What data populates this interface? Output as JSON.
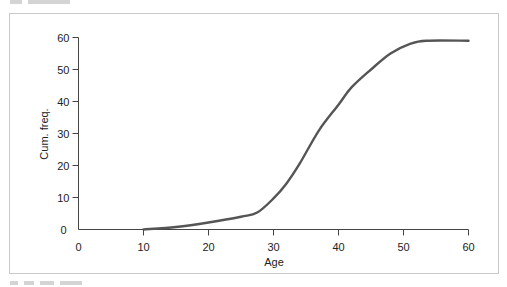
{
  "chart_data": {
    "type": "line",
    "title": "",
    "xlabel": "Age",
    "ylabel": "Cum. freq.",
    "xlim": [
      0,
      60
    ],
    "ylim": [
      0,
      60
    ],
    "xticks": [
      0,
      10,
      20,
      30,
      40,
      50,
      60
    ],
    "yticks": [
      0,
      10,
      20,
      30,
      40,
      50,
      60
    ],
    "grid": false,
    "legend": null,
    "series": [
      {
        "name": "Cumulative frequency",
        "color": "#555555",
        "x": [
          10,
          15,
          20,
          25,
          27.5,
          30,
          32,
          34,
          37,
          40,
          42,
          45,
          48,
          51,
          53.5,
          60
        ],
        "y": [
          0,
          0.8,
          2.2,
          4.0,
          5.3,
          9.7,
          14.4,
          20.5,
          31,
          39,
          44.4,
          50,
          55,
          58,
          59,
          59
        ]
      }
    ]
  }
}
